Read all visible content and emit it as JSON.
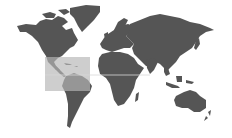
{
  "map": {
    "type": "world-map",
    "land_color": "#555555",
    "background_color": "#ffffff",
    "highlight": {
      "region": "Central America / Caribbean",
      "fill_color": "#c8c8c8",
      "bounds_px": {
        "x": 45,
        "y": 57,
        "width": 45,
        "height": 34
      }
    },
    "reference_line": {
      "label": "equator",
      "y_px": 75,
      "color": "#d8d8d8"
    },
    "continents": [
      "North America",
      "Greenland",
      "South America",
      "Europe",
      "Africa",
      "Asia",
      "Australia",
      "New Zealand"
    ]
  }
}
